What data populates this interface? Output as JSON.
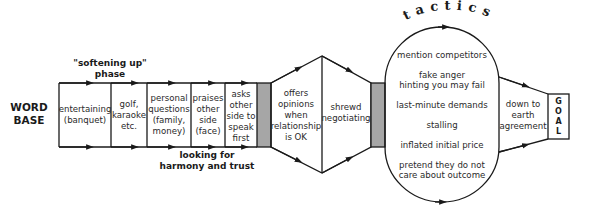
{
  "diagram": {
    "start_label": [
      "WORD",
      "BASE"
    ],
    "softening_label": [
      "\"softening up\"",
      "phase"
    ],
    "harmony_label": [
      "looking for",
      "harmony and trust"
    ],
    "phase_boxes": [
      {
        "lines": [
          "entertaining",
          "(banquet)"
        ]
      },
      {
        "lines": [
          "golf,",
          "karaoke",
          "etc."
        ]
      },
      {
        "lines": [
          "personal",
          "questions",
          "(family,",
          "money)"
        ]
      },
      {
        "lines": [
          "praises",
          "other",
          "side",
          "(face)"
        ]
      },
      {
        "lines": [
          "asks",
          "other",
          "side to",
          "speak",
          "first"
        ]
      }
    ],
    "hexagon": {
      "left": [
        "offers",
        "opinions",
        "when",
        "relationship",
        "is OK"
      ],
      "right": [
        "shrewd",
        "negotiating"
      ]
    },
    "tactics_title": "tactics",
    "tactics": [
      [
        "mention competitors"
      ],
      [
        "fake anger",
        "hinting you may fail"
      ],
      [
        "last-minute demands"
      ],
      [
        "stalling"
      ],
      [
        "inflated initial price"
      ],
      [
        "pretend they do not",
        "care about outcome"
      ]
    ],
    "agreement": [
      "down to",
      "earth",
      "agreement"
    ],
    "goal": [
      "G",
      "O",
      "A",
      "L"
    ],
    "colors": {
      "line": "#1a1a1a",
      "gray_block": "#a6a6a6",
      "text": "#2a2a2a"
    }
  }
}
